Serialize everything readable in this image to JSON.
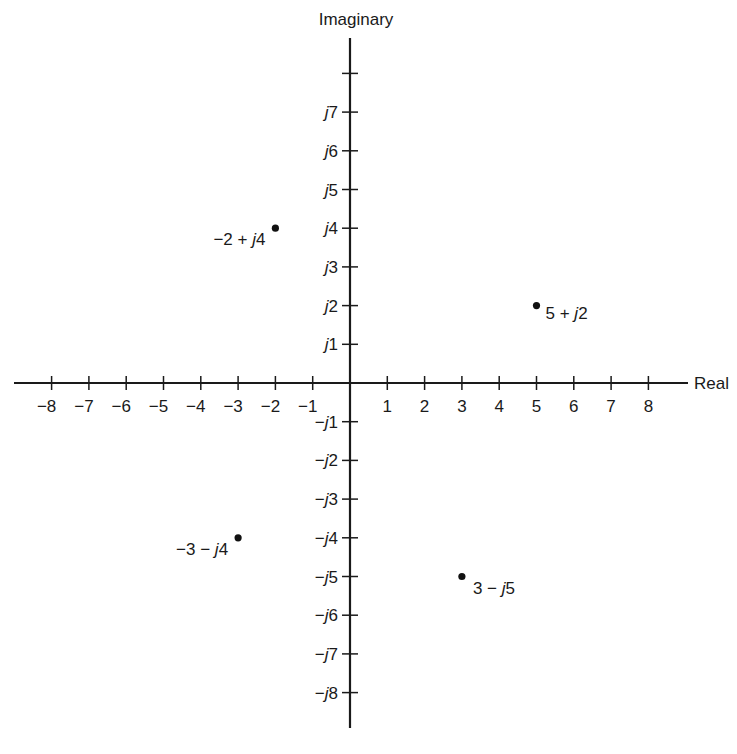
{
  "chart_data": {
    "type": "scatter",
    "title": "",
    "xlabel": "Real",
    "ylabel": "Imaginary",
    "xlim": [
      -9,
      9
    ],
    "ylim": [
      -9,
      9
    ],
    "grid": false,
    "legend": null,
    "x_ticks": [
      -8,
      -7,
      -6,
      -5,
      -4,
      -3,
      -2,
      -1,
      1,
      2,
      3,
      4,
      5,
      6,
      7,
      8
    ],
    "x_tick_labels": [
      "−8",
      "−7",
      "−6",
      "−5",
      "−4",
      "−3",
      "−2",
      "−1",
      "1",
      "2",
      "3",
      "4",
      "5",
      "6",
      "7",
      "8"
    ],
    "y_ticks": [
      8,
      7,
      6,
      5,
      4,
      3,
      2,
      1,
      -1,
      -2,
      -3,
      -4,
      -5,
      -6,
      -7,
      -8
    ],
    "y_tick_labels": [
      "",
      "j7",
      "j6",
      "j5",
      "j4",
      "j3",
      "j2",
      "j1",
      "−j1",
      "−j2",
      "−j3",
      "−j4",
      "−j5",
      "−j6",
      "−j7",
      "−j8"
    ],
    "points": [
      {
        "x": -2,
        "y": 4,
        "label": "−2 + j4"
      },
      {
        "x": 5,
        "y": 2,
        "label": "5 + j2"
      },
      {
        "x": -3,
        "y": -4,
        "label": "−3 − j4"
      },
      {
        "x": 3,
        "y": -5,
        "label": "3 − j5"
      }
    ]
  },
  "labels": {
    "x_axis": "Real",
    "y_axis": "Imaginary"
  }
}
